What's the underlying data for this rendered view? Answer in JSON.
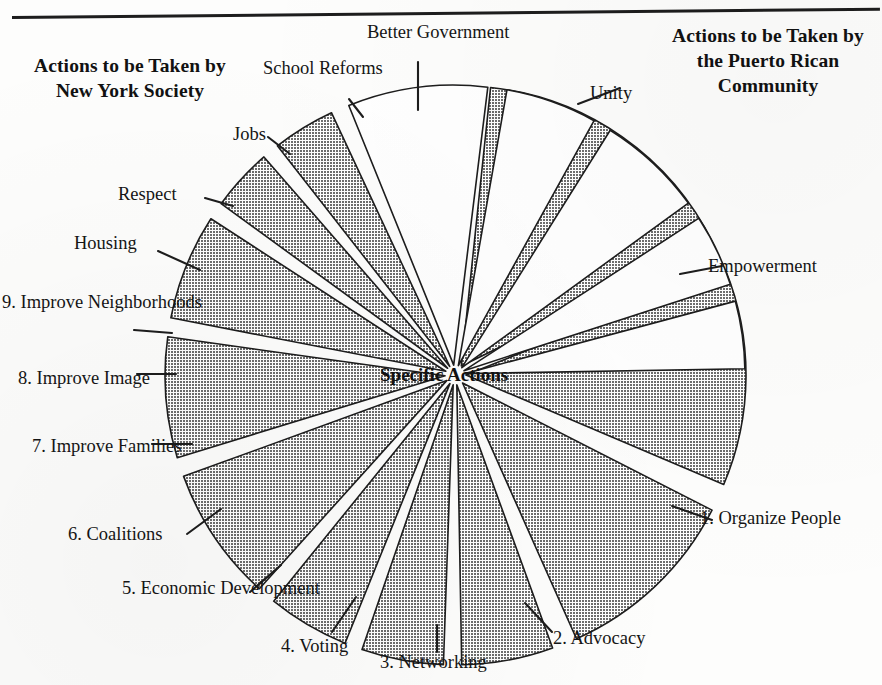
{
  "page": {
    "width": 882,
    "height": 685,
    "top_rule": "horizontal-rule"
  },
  "headings": {
    "left": "Actions to\nbe Taken by\nNew York\nSociety",
    "right": "Actions to be\nTaken by the\nPuerto Rican\nCommunity"
  },
  "center_label": "Specific Actions",
  "colors": {
    "gray_fill": "#9a9a9a",
    "white_fill": "#ffffff",
    "stroke": "#1d1d1d",
    "text": "#151515",
    "background": "#fdfdfc"
  },
  "chart_data": {
    "type": "pie",
    "title": "Specific Actions",
    "subtitle": "",
    "xlabel": "",
    "ylabel": "",
    "grid": false,
    "legend_position": "none",
    "exploded": true,
    "center": [
      455,
      375
    ],
    "radius": 280,
    "start_angle_deg": -90,
    "direction": "clockwise",
    "groups": [
      {
        "name": "Actions to be Taken by the Puerto Rican Community",
        "fill": "#9a9a9a",
        "heading_position": "right"
      },
      {
        "name": "Actions to be Taken by New York Society",
        "fill": "#ffffff",
        "heading_position": "left"
      }
    ],
    "categories": [
      "Unity",
      "Empowerment",
      "1. Organize People",
      "2. Advocacy",
      "3. Networking",
      "4. Voting",
      "5. Economic Development",
      "6. Coalitions",
      "7. Improve Families",
      "8. Improve Image",
      "9. Improve Neighborhoods",
      "Housing",
      "Respect",
      "Jobs",
      "School Reforms",
      "Better Government"
    ],
    "values": [
      58,
      45,
      39,
      19,
      17,
      17,
      28,
      25,
      22,
      13,
      13,
      29,
      19,
      22,
      15,
      14
    ],
    "slices": [
      {
        "label": "Unity",
        "group": "Puerto Rican Community",
        "fill": "#9a9a9a",
        "start_deg": -84,
        "end_deg": -26,
        "explode": 11,
        "label_pos": [
          590,
          83
        ],
        "label_align": "left",
        "leader_from": [
          578,
          104
        ],
        "leader_to": [
          620,
          88
        ]
      },
      {
        "label": "Empowerment",
        "group": "Puerto Rican Community",
        "fill": "#9a9a9a",
        "start_deg": -22,
        "end_deg": 23,
        "explode": 11,
        "label_pos": [
          708,
          256
        ],
        "label_align": "left",
        "leader_from": [
          680,
          274
        ],
        "leader_to": [
          722,
          266
        ]
      },
      {
        "label": "1. Organize People",
        "group": "Puerto Rican Community",
        "fill": "#9a9a9a",
        "start_deg": 27,
        "end_deg": 66,
        "explode": 11,
        "label_pos": [
          700,
          508
        ],
        "label_align": "left",
        "leader_from": [
          672,
          506
        ],
        "leader_to": [
          712,
          520
        ]
      },
      {
        "label": "2. Advocacy",
        "group": "Puerto Rican Community",
        "fill": "#9a9a9a",
        "start_deg": 70,
        "end_deg": 89,
        "explode": 10,
        "label_pos": [
          553,
          628
        ],
        "label_align": "left",
        "leader_from": [
          525,
          603
        ],
        "leader_to": [
          552,
          632
        ]
      },
      {
        "label": "3. Networking",
        "group": "Puerto Rican Community",
        "fill": "#9a9a9a",
        "start_deg": 92,
        "end_deg": 109,
        "explode": 10,
        "label_pos": [
          380,
          652
        ],
        "label_align": "left",
        "leader_from": [
          437,
          625
        ],
        "leader_to": [
          437,
          652
        ]
      },
      {
        "label": "4. Voting",
        "group": "Puerto Rican Community",
        "fill": "#9a9a9a",
        "start_deg": 112,
        "end_deg": 129,
        "explode": 10,
        "label_pos": [
          281,
          636
        ],
        "label_align": "left",
        "leader_from": [
          356,
          597
        ],
        "leader_to": [
          332,
          632
        ]
      },
      {
        "label": "5. Economic Development",
        "group": "Puerto Rican Community",
        "fill": "#9a9a9a",
        "start_deg": 132,
        "end_deg": 160,
        "explode": 10,
        "label_pos": [
          122,
          578
        ],
        "label_align": "left",
        "leader_from": [
          281,
          565
        ],
        "leader_to": [
          250,
          592
        ]
      },
      {
        "label": "6. Coalitions",
        "group": "Puerto Rican Community",
        "fill": "#9a9a9a",
        "start_deg": 163,
        "end_deg": 188,
        "explode": 10,
        "label_pos": [
          68,
          524
        ],
        "label_align": "left",
        "leader_from": [
          221,
          509
        ],
        "leader_to": [
          187,
          534
        ]
      },
      {
        "label": "7. Improve Families",
        "group": "Puerto Rican Community",
        "fill": "#9a9a9a",
        "start_deg": 191,
        "end_deg": 213,
        "explode": 10,
        "label_pos": [
          32,
          436
        ],
        "label_align": "left",
        "leader_from": [
          192,
          444
        ],
        "leader_to": [
          152,
          444
        ]
      },
      {
        "label": "8. Improve Image",
        "group": "Puerto Rican Community",
        "fill": "#9a9a9a",
        "start_deg": 216,
        "end_deg": 229,
        "explode": 10,
        "label_pos": [
          18,
          368
        ],
        "label_align": "left",
        "leader_from": [
          176,
          374
        ],
        "leader_to": [
          137,
          374
        ]
      },
      {
        "label": "9. Improve Neighborhoods",
        "group": "Puerto Rican Community",
        "fill": "#9a9a9a",
        "start_deg": 232,
        "end_deg": 245,
        "explode": 10,
        "label_pos": [
          2,
          292
        ],
        "label_align": "left",
        "leader_from": [
          172,
          333
        ],
        "leader_to": [
          134,
          330
        ]
      },
      {
        "label": "Housing",
        "group": "New York Society",
        "fill": "#ffffff",
        "start_deg": 248,
        "end_deg": 277,
        "explode": 10,
        "label_pos": [
          74,
          233
        ],
        "label_align": "left",
        "leader_from": [
          200,
          270
        ],
        "leader_to": [
          158,
          251
        ]
      },
      {
        "label": "Respect",
        "group": "New York Society",
        "fill": "#ffffff",
        "start_deg": 280,
        "end_deg": 299,
        "explode": 10,
        "label_pos": [
          118,
          184
        ],
        "label_align": "left",
        "leader_from": [
          233,
          206
        ],
        "leader_to": [
          205,
          198
        ]
      },
      {
        "label": "Jobs",
        "group": "New York Society",
        "fill": "#ffffff",
        "start_deg": 302,
        "end_deg": 324,
        "explode": 10,
        "label_pos": [
          233,
          124
        ],
        "label_align": "left",
        "leader_from": [
          290,
          154
        ],
        "leader_to": [
          268,
          137
        ]
      },
      {
        "label": "School Reforms",
        "group": "New York Society",
        "fill": "#ffffff",
        "start_deg": 327,
        "end_deg": 342,
        "explode": 10,
        "label_pos": [
          263,
          58
        ],
        "label_align": "left",
        "leader_from": [
          363,
          117
        ],
        "leader_to": [
          349,
          99
        ]
      },
      {
        "label": "Better Government",
        "group": "New York Society",
        "fill": "#ffffff",
        "start_deg": 345,
        "end_deg": 359,
        "explode": 10,
        "label_pos": [
          367,
          22
        ],
        "label_align": "left",
        "leader_from": [
          418,
          110
        ],
        "leader_to": [
          418,
          62
        ]
      }
    ]
  }
}
